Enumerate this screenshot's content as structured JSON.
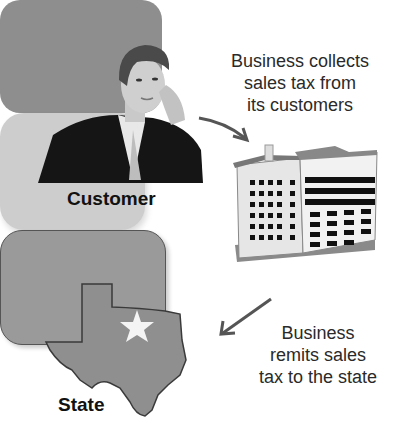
{
  "nodes": {
    "customer": {
      "label": "Customer",
      "icon": "businessman-on-phone-illustration"
    },
    "business": {
      "icon": "office-building-illustration"
    },
    "state": {
      "label": "State",
      "icon": "texas-map-with-star"
    }
  },
  "edges": [
    {
      "from": "customer",
      "to": "business",
      "caption_lines": [
        "Business collects",
        "sales tax from",
        "its customers"
      ]
    },
    {
      "from": "business",
      "to": "state",
      "caption_lines": [
        "Business",
        "remits sales",
        "tax to the state"
      ]
    }
  ],
  "colors": {
    "background": "#ffffff",
    "tile_dark": "#8e8e8e",
    "tile_light": "#cdcdcd",
    "text": "#2a2a2a",
    "arrow": "#555555"
  }
}
